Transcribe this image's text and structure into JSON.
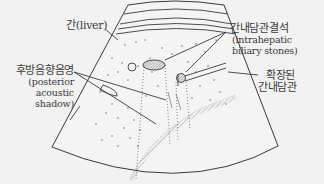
{
  "diagram": {
    "labels": {
      "liver": {
        "ko": "간(liver)"
      },
      "stones": {
        "ko": "간내담관결석",
        "en_line1": "(intrahepatic",
        "en_line2": "biliary stones)"
      },
      "dilated_duct": {
        "ko_line1": "확장된",
        "ko_line2": "간내담관"
      },
      "shadow": {
        "ko": "후방음향음영",
        "en_line1": "(posterior",
        "en_line2": "acoustic",
        "en_line3": "shadow)"
      }
    },
    "colors": {
      "background": "#f2f2f2",
      "line": "#3a3a3a",
      "speckle": "#555555"
    }
  }
}
